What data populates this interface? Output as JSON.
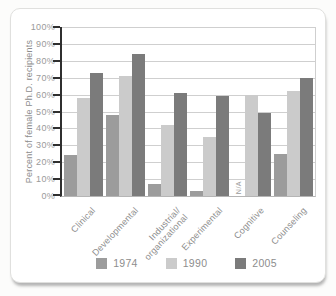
{
  "chart_data": {
    "type": "bar",
    "title": "",
    "ylabel": "Percent of female Ph.D. recipients",
    "xlabel": "",
    "ylim": [
      0,
      100
    ],
    "y_tick_step": 10,
    "y_tick_suffix": "%",
    "grid": true,
    "legend_position": "bottom",
    "categories": [
      "Clinical",
      "Developmental",
      "Industrial/\norganizational",
      "Experimental",
      "Cognitive",
      "Counseling"
    ],
    "na_label": "N/A",
    "series": [
      {
        "name": "1974",
        "color": "#9c9c9c",
        "values": [
          24,
          48,
          7,
          3,
          null,
          25
        ]
      },
      {
        "name": "1990",
        "color": "#cbcbcb",
        "values": [
          58,
          71,
          42,
          35,
          60,
          62
        ]
      },
      {
        "name": "2005",
        "color": "#7b7b7b",
        "values": [
          73,
          84,
          61,
          59,
          49,
          70
        ]
      }
    ]
  },
  "colors": {
    "axis": "#2f2f2f",
    "grid": "#cfcfcf",
    "baseline": "#b5b5b5",
    "text": "#8d8d8d",
    "tick_text": "#9a9a9a",
    "na_text": "#9b9b9b",
    "card_border": "#e0e0de",
    "card_bg": "#ffffff",
    "page_bg": "#fcfcfb"
  }
}
